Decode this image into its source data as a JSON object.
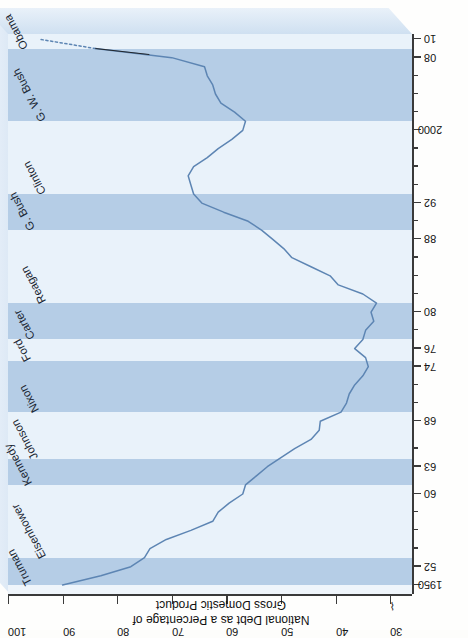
{
  "figure": {
    "orientation": "rotated-90-ccw",
    "annotation": "2010 OMB\nbudget\nprediction",
    "colors": {
      "line": "#5d85b3",
      "stripe_dark": "#b5cde6",
      "stripe_light": "#e9f2fa",
      "axis": "#3a3a3a",
      "slab_top": "#dce8f5",
      "slab_side": "#cfe0f1"
    }
  },
  "chart_data": {
    "type": "line",
    "title": "",
    "xlabel": "",
    "ylabel": "National Debt as a Percentage of Gross Domestic Product",
    "ylabel_lines": [
      "National Debt as a Percentage of",
      "Gross Domestic Product"
    ],
    "xlim": [
      1949,
      2010.6
    ],
    "ylim": [
      26,
      100
    ],
    "yticks": [
      30,
      40,
      50,
      60,
      70,
      80,
      90,
      100
    ],
    "ytick_labels": [
      "30",
      "40",
      "50",
      "60",
      "70",
      "80",
      "90",
      "100"
    ],
    "y_axis_break": true,
    "y_axis_break_symbol": "⌇",
    "xticks": [
      1950,
      1952,
      1960,
      1963,
      1968,
      1974,
      1976,
      1980,
      1988,
      1992,
      2000,
      2008,
      2010
    ],
    "xtick_labels": [
      "1950",
      "52",
      "60",
      "63",
      "68",
      "74",
      "76",
      "80",
      "88",
      "92",
      "2000",
      "08",
      "10"
    ],
    "x_minor_ticks": [
      1954,
      1956,
      1958,
      1965,
      1970,
      1972,
      1978,
      1982,
      1984,
      1986,
      1990,
      1994,
      1996,
      1998,
      2002,
      2004,
      2006
    ],
    "grid": false,
    "legend": "none",
    "series": [
      {
        "name": "National debt as % of GDP (actual)",
        "style": "solid",
        "x": [
          1950,
          1951,
          1952,
          1953,
          1954,
          1955,
          1956,
          1957,
          1958,
          1959,
          1960,
          1961,
          1962,
          1963,
          1964,
          1965,
          1966,
          1967,
          1968,
          1969,
          1970,
          1971,
          1972,
          1973,
          1974,
          1975,
          1976,
          1977,
          1978,
          1979,
          1980,
          1981,
          1982,
          1983,
          1984,
          1985,
          1986,
          1987,
          1988,
          1989,
          1990,
          1991,
          1992,
          1993,
          1994,
          1995,
          1996,
          1997,
          1998,
          1999,
          2000,
          2001,
          2002,
          2003,
          2004,
          2005,
          2006,
          2007,
          2008,
          2009
        ],
        "y": [
          90.0,
          83.0,
          77.5,
          75.0,
          74.0,
          71.0,
          66.5,
          62.5,
          61.5,
          59.5,
          57.0,
          56.5,
          54.5,
          52.5,
          50.0,
          47.5,
          44.5,
          43.0,
          42.8,
          39.0,
          38.0,
          37.5,
          36.5,
          35.0,
          34.0,
          34.5,
          36.5,
          35.0,
          34.5,
          33.0,
          33.5,
          32.5,
          35.0,
          39.5,
          41.0,
          44.5,
          48.0,
          49.5,
          51.5,
          53.5,
          56.0,
          60.5,
          64.5,
          66.0,
          66.5,
          67.0,
          66.0,
          63.5,
          61.5,
          59.0,
          57.0,
          56.5,
          58.5,
          61.0,
          62.0,
          62.5,
          63.5,
          64.0,
          70.0,
          84.0
        ]
      },
      {
        "name": "2010 OMB budget prediction",
        "style": "dotted",
        "x": [
          2009,
          2010
        ],
        "y": [
          84.0,
          94.0
        ]
      }
    ],
    "presidents": [
      {
        "name": "Truman",
        "start": 1950,
        "end": 1953,
        "shade": "dark"
      },
      {
        "name": "Eisenhower",
        "start": 1953,
        "end": 1961,
        "shade": "light"
      },
      {
        "name": "Kennedy",
        "start": 1961,
        "end": 1963.9,
        "shade": "dark"
      },
      {
        "name": "Johnson",
        "start": 1963.9,
        "end": 1969,
        "shade": "light"
      },
      {
        "name": "Nixon",
        "start": 1969,
        "end": 1974.6,
        "shade": "dark"
      },
      {
        "name": "Ford",
        "start": 1974.6,
        "end": 1977,
        "shade": "light"
      },
      {
        "name": "Carter",
        "start": 1977,
        "end": 1981,
        "shade": "dark"
      },
      {
        "name": "Reagan",
        "start": 1981,
        "end": 1989,
        "shade": "light"
      },
      {
        "name": "G. Bush",
        "start": 1989,
        "end": 1993,
        "shade": "dark"
      },
      {
        "name": "Clinton",
        "start": 1993,
        "end": 2001,
        "shade": "light"
      },
      {
        "name": "G. W. Bush",
        "start": 2001,
        "end": 2009,
        "shade": "dark"
      },
      {
        "name": "Obama",
        "start": 2009,
        "end": 2010.6,
        "shade": "light"
      }
    ]
  }
}
